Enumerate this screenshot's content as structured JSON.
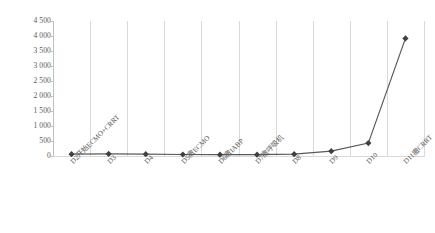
{
  "chart_data": {
    "type": "line",
    "title": "",
    "subtitle": "",
    "xlabel": "",
    "ylabel": "",
    "categories": [
      "D2开始ECMO+CRRT",
      "D3",
      "D4",
      "D5撤ECMO",
      "D6撤IABP",
      "D7撤呼吸机",
      "D8",
      "D9",
      "D10",
      "D11撤CRRT"
    ],
    "values": [
      60,
      70,
      60,
      50,
      45,
      45,
      60,
      160,
      430,
      3920
    ],
    "series": [
      {
        "name": "series-1",
        "values": [
          60,
          70,
          60,
          50,
          45,
          45,
          60,
          160,
          430,
          3920
        ]
      }
    ],
    "ylim": [
      0,
      4500
    ],
    "ytick_labels": [
      "0",
      "500",
      "1 000",
      "1 500",
      "2 000",
      "2 500",
      "3 000",
      "3 500",
      "4 000",
      "4 500"
    ],
    "ytick_values": [
      0,
      500,
      1000,
      1500,
      2000,
      2500,
      3000,
      3500,
      4000,
      4500
    ],
    "grid": {
      "vertical": true,
      "horizontal": false
    },
    "legend": {
      "visible": false,
      "position": "none"
    },
    "colors": {
      "line": "#595959",
      "marker": "#404040",
      "grid": "#d9d9d9",
      "axis": "#bfbfbf",
      "text": "#595959",
      "background": "#ffffff"
    },
    "marker_shape": "diamond"
  }
}
